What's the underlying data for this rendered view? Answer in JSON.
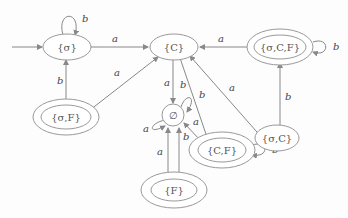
{
  "diagram": {
    "type": "finite-automaton",
    "nodes": [
      {
        "id": "sigma",
        "label": "{σ}",
        "accepting": false,
        "initial": true
      },
      {
        "id": "C",
        "label": "{C}",
        "accepting": false,
        "initial": false
      },
      {
        "id": "sigmaCF",
        "label": "{σ,C,F}",
        "accepting": true,
        "initial": false
      },
      {
        "id": "sigmaF",
        "label": "{σ,F}",
        "accepting": true,
        "initial": false
      },
      {
        "id": "empty",
        "label": "∅",
        "accepting": false,
        "initial": false
      },
      {
        "id": "sigmaC",
        "label": "{σ,C}",
        "accepting": false,
        "initial": false
      },
      {
        "id": "CF",
        "label": "{C,F}",
        "accepting": true,
        "initial": false
      },
      {
        "id": "F",
        "label": "{F}",
        "accepting": true,
        "initial": false
      }
    ],
    "edges": [
      {
        "from": "sigma",
        "to": "sigma",
        "label": "b"
      },
      {
        "from": "sigma",
        "to": "C",
        "label": "a"
      },
      {
        "from": "sigmaCF",
        "to": "C",
        "label": "a"
      },
      {
        "from": "sigmaCF",
        "to": "sigmaCF",
        "label": "b"
      },
      {
        "from": "sigmaF",
        "to": "sigma",
        "label": "b"
      },
      {
        "from": "sigmaF",
        "to": "C",
        "label": "a"
      },
      {
        "from": "C",
        "to": "empty",
        "label": "a"
      },
      {
        "from": "C",
        "to": "CF",
        "label": "b"
      },
      {
        "from": "sigmaC",
        "to": "C",
        "label": "a"
      },
      {
        "from": "sigmaC",
        "to": "sigmaCF",
        "label": "b"
      },
      {
        "from": "empty",
        "to": "empty",
        "label": "b"
      },
      {
        "from": "empty",
        "to": "empty",
        "label": "a"
      },
      {
        "from": "CF",
        "to": "empty",
        "label": "a"
      },
      {
        "from": "CF",
        "to": "CF",
        "label": "b"
      },
      {
        "from": "F",
        "to": "empty",
        "label": "a"
      },
      {
        "from": "F",
        "to": "empty",
        "label": "b"
      }
    ],
    "labels": {
      "sigma": "{σ}",
      "C": "{C}",
      "sigmaCF": "{σ,C,F}",
      "sigmaF": "{σ,F}",
      "empty": "∅",
      "sigmaC": "{σ,C}",
      "CF": "{C,F}",
      "F": "{F}",
      "a": "a",
      "b": "b"
    }
  }
}
